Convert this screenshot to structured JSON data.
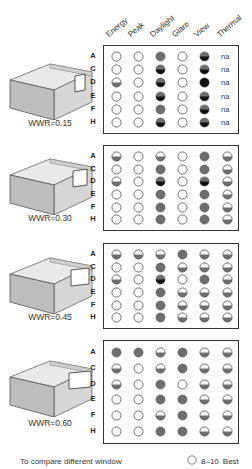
{
  "columns": [
    "Energy",
    "Peak",
    "Daylight",
    "Glare",
    "View",
    "Thermal"
  ],
  "row_labels": [
    "A",
    "C",
    "D",
    "E",
    "F",
    "H"
  ],
  "legend": {
    "symbol": "empty",
    "range": "8–10",
    "label": "Best"
  },
  "footer_text": "To compare different window",
  "colors": {
    "gray": "#6e6e6e",
    "black": "#111111",
    "outline": "#555555"
  },
  "blocks": [
    {
      "wwr_label": "WWR=0.15",
      "rows": [
        [
          "empty",
          "empty",
          "gray",
          "empty",
          "darkbottom",
          "na"
        ],
        [
          "empty",
          "empty",
          "darkbottom",
          "empty",
          "darkbottom",
          "na"
        ],
        [
          "half",
          "empty",
          "darkbottom",
          "empty",
          "black",
          "na"
        ],
        [
          "empty",
          "empty",
          "darkbottom",
          "empty",
          "darkbottom",
          "na"
        ],
        [
          "empty",
          "empty",
          "gray",
          "empty",
          "darkbottom",
          "na"
        ],
        [
          "empty",
          "empty",
          "darkbottom",
          "empty",
          "darkbottom",
          "na"
        ]
      ]
    },
    {
      "wwr_label": "WWR=0.30",
      "rows": [
        [
          "half",
          "empty",
          "half",
          "empty",
          "gray",
          "half"
        ],
        [
          "empty",
          "empty",
          "gray",
          "empty",
          "gray",
          "half"
        ],
        [
          "half",
          "empty",
          "darkbottom",
          "empty",
          "darkbottom",
          "half"
        ],
        [
          "empty",
          "empty",
          "gray",
          "empty",
          "gray",
          "half"
        ],
        [
          "empty",
          "empty",
          "gray",
          "empty",
          "gray",
          "half"
        ],
        [
          "empty",
          "empty",
          "gray",
          "empty",
          "gray",
          "half"
        ]
      ]
    },
    {
      "wwr_label": "WWR=0.45",
      "rows": [
        [
          "half",
          "half",
          "half",
          "gray",
          "half",
          "half"
        ],
        [
          "empty",
          "empty",
          "gray",
          "half",
          "half",
          "half"
        ],
        [
          "half",
          "empty",
          "darkbottom",
          "empty",
          "gray",
          "half"
        ],
        [
          "empty",
          "empty",
          "gray",
          "half",
          "half",
          "half"
        ],
        [
          "empty",
          "empty",
          "gray",
          "half",
          "half",
          "half"
        ],
        [
          "empty",
          "empty",
          "gray",
          "half",
          "half",
          "half"
        ]
      ]
    },
    {
      "wwr_label": "WWR=0.60",
      "rows": [
        [
          "gray",
          "gray",
          "half",
          "gray",
          "half",
          "half"
        ],
        [
          "half",
          "empty",
          "half",
          "gray",
          "half",
          "half"
        ],
        [
          "half",
          "empty",
          "gray",
          "empty",
          "half",
          "half"
        ],
        [
          "empty",
          "empty",
          "gray",
          "gray",
          "half",
          "half"
        ],
        [
          "empty",
          "empty",
          "half",
          "gray",
          "half",
          "half"
        ],
        [
          "empty",
          "empty",
          "gray",
          "gray",
          "half",
          "half"
        ]
      ]
    }
  ]
}
